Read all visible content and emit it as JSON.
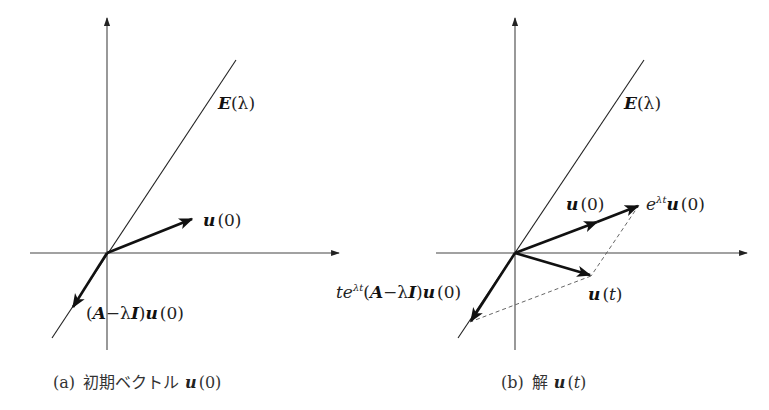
{
  "panel_a": {
    "eigenspace_label": {
      "name": "E",
      "arg": "(λ)"
    },
    "u0_label": {
      "vec": "u",
      "arg": "(0)"
    },
    "generalized_label": {
      "open": "(",
      "A": "A",
      "minus": "−λ",
      "I": "I",
      "close": ")",
      "vec": "u",
      "arg": "(0)"
    },
    "caption": {
      "tag": "(a)",
      "text": "初期ベクトル",
      "vec": "u",
      "arg": "(0)"
    }
  },
  "panel_b": {
    "eigenspace_label": {
      "name": "E",
      "arg": "(λ)"
    },
    "u0_label": {
      "vec": "u",
      "arg": "(0)"
    },
    "exp_label": {
      "base": "e",
      "sup": "λt",
      "vec": "u",
      "arg": "(0)"
    },
    "ut_label": {
      "vec": "u",
      "open": "(",
      "t": "t",
      "close": ")"
    },
    "gen_term_label": {
      "t": "t",
      "e": "e",
      "sup": "λt",
      "open": "(",
      "A": "A",
      "minus": "−λ",
      "I": "I",
      "close": ")",
      "vec": "u",
      "arg": "(0)"
    },
    "caption": {
      "tag": "(b)",
      "text": "解",
      "vec": "u",
      "open": "(",
      "t": "t",
      "close": ")"
    }
  },
  "colors": {
    "ink": "#111111",
    "axis": "#444444",
    "dash": "#555555",
    "background": "#ffffff"
  }
}
